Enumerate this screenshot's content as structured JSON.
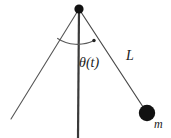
{
  "figure": {
    "kind": "physics-diagram",
    "background_color": "#ffffff",
    "stroke_color": "#4a4a4a",
    "vertical_stroke_color": "#3a3a3a",
    "marker_color": "#111111",
    "label_color": "#1a1a1a"
  },
  "labels": {
    "angle": "θ(t)",
    "length": "L",
    "mass": "m"
  },
  "geometry": {
    "pivot": {
      "x": 79,
      "y": 9,
      "radius": 4.6
    },
    "bob": {
      "x": 147,
      "y": 113,
      "radius": 8.2
    },
    "vertical_line": {
      "x1": 79,
      "y1": 9,
      "x2": 78,
      "y2": 138,
      "width": 2.2
    },
    "left_line": {
      "x1": 79,
      "y1": 9,
      "x2": 11,
      "y2": 119,
      "width": 1.1
    },
    "rod_line": {
      "x1": 79,
      "y1": 9,
      "x2": 147,
      "y2": 113,
      "width": 1.1
    },
    "arc": {
      "cx": 79,
      "cy": 9,
      "radius": 37,
      "start_x": 57,
      "start_y": 38,
      "end_x": 94,
      "end_y": 41
    },
    "arc_end_marker": {
      "x": 94,
      "y": 40.5,
      "radius": 1.6
    }
  }
}
